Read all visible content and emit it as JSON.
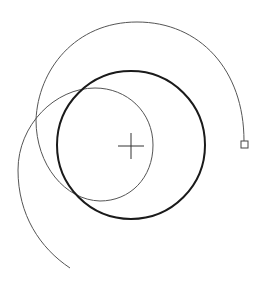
{
  "diagram": {
    "background": "#ffffff",
    "main_circle": {
      "cx": 131,
      "cy": 145,
      "r": 74,
      "stroke": "#1a1a1a",
      "width": 2
    },
    "center_marker": {
      "x": 131,
      "y": 146,
      "arm": 13,
      "stroke": "#333333"
    },
    "spiral": {
      "stroke": "#555555",
      "width": 1
    },
    "end_handle": {
      "x": 241,
      "y": 141,
      "size": 7,
      "stroke": "#444444"
    }
  }
}
